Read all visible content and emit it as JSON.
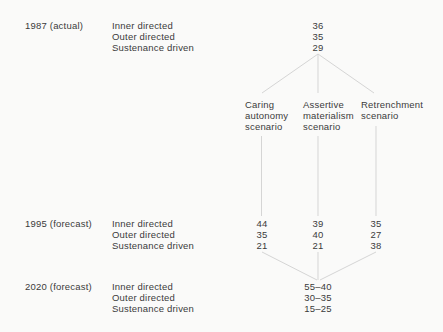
{
  "colors": {
    "background": "#fafaf9",
    "text": "#3b3b3b",
    "connector_line": "#d5d5d5"
  },
  "sections": [
    {
      "period": "1987 (actual)",
      "categories": [
        "Inner directed",
        "Outer directed",
        "Sustenance driven"
      ],
      "columns": [
        {
          "values": [
            "36",
            "35",
            "29"
          ]
        }
      ]
    },
    {
      "period": "1995 (forecast)",
      "categories": [
        "Inner directed",
        "Outer directed",
        "Sustenance driven"
      ],
      "columns": [
        {
          "values": [
            "44",
            "35",
            "21"
          ]
        },
        {
          "values": [
            "39",
            "40",
            "21"
          ]
        },
        {
          "values": [
            "35",
            "27",
            "38"
          ]
        }
      ]
    },
    {
      "period": "2020 (forecast)",
      "categories": [
        "Inner directed",
        "Outer directed",
        "Sustenance driven"
      ],
      "columns": [
        {
          "values": [
            "55–40",
            "30–35",
            "15–25"
          ]
        }
      ]
    }
  ],
  "scenarios": [
    {
      "lines": [
        "Caring",
        "autonomy",
        "scenario"
      ]
    },
    {
      "lines": [
        "Assertive",
        "materialism",
        "scenario"
      ]
    },
    {
      "lines": [
        "Retrenchment",
        "scenario"
      ]
    }
  ]
}
